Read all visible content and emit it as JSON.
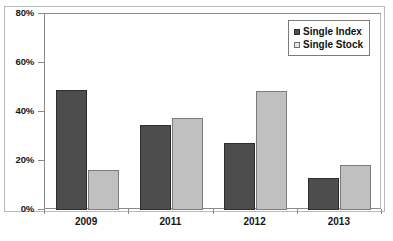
{
  "chart_data": {
    "type": "bar",
    "title": "",
    "subtitle": "",
    "xlabel": "",
    "ylabel": "",
    "categories": [
      "2009",
      "2011",
      "2012",
      "2013"
    ],
    "series": [
      {
        "name": "Single Index",
        "color": "#4d4d4d",
        "values": [
          48.8,
          34.5,
          27.4,
          13.2
        ]
      },
      {
        "name": "Single Stock",
        "color": "#c0c0c0",
        "values": [
          16.2,
          37.5,
          48.4,
          18.4
        ]
      }
    ],
    "ylim": [
      0,
      80
    ],
    "yticks": [
      0,
      20,
      40,
      60,
      80
    ],
    "ytick_labels": [
      "0%",
      "20%",
      "40%",
      "60%",
      "80%"
    ],
    "grid": false,
    "legend_position": "top-right",
    "value_format": "percent"
  },
  "legend": {
    "entries": [
      {
        "label": "Single Index",
        "swatch": "dark-square-swatch"
      },
      {
        "label": "Single Stock",
        "swatch": "light-square-swatch"
      }
    ]
  },
  "caption": {
    "text": ""
  }
}
